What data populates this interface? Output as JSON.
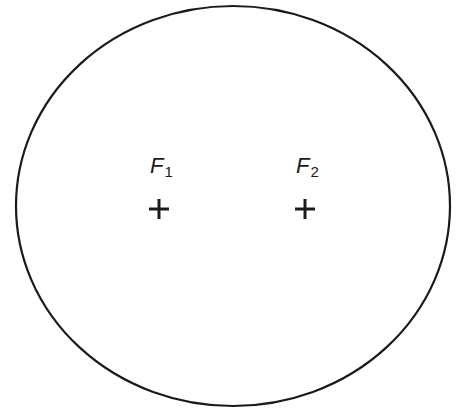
{
  "diagram": {
    "type": "ellipse-with-foci",
    "stroke_color": "#1a1a1a",
    "background": "#ffffff",
    "ellipse": {
      "cx": 233,
      "cy": 206,
      "rx": 217,
      "ry": 200
    },
    "foci": [
      {
        "name": "F",
        "subscript": "1",
        "x": 159,
        "y": 209
      },
      {
        "name": "F",
        "subscript": "2",
        "x": 305,
        "y": 209
      }
    ]
  }
}
